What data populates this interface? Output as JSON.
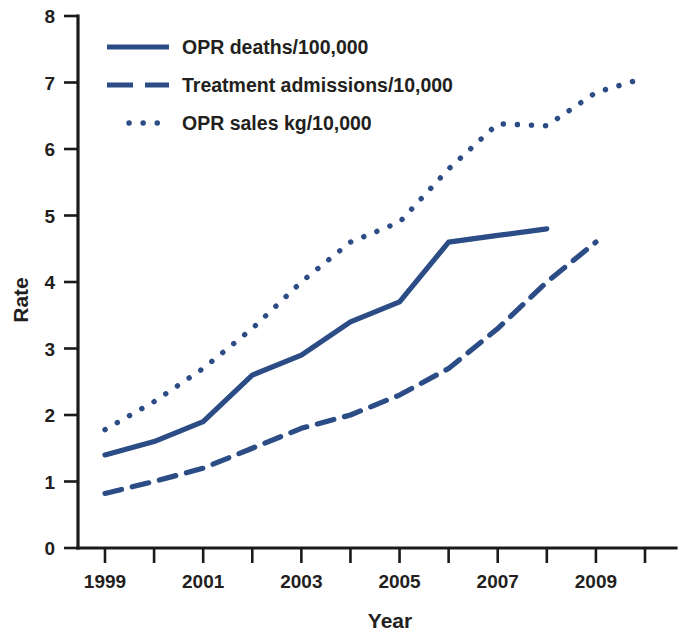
{
  "chart_data": {
    "type": "line",
    "title": "",
    "xlabel": "Year",
    "ylabel": "Rate",
    "xlim": [
      1999,
      2010
    ],
    "ylim": [
      0,
      8
    ],
    "grid": false,
    "legend_position": "top-left",
    "x": [
      1999,
      2000,
      2001,
      2002,
      2003,
      2004,
      2005,
      2006,
      2007,
      2008,
      2009,
      2010
    ],
    "xtick_labels": [
      "1999",
      "",
      "2001",
      "",
      "2003",
      "",
      "2005",
      "",
      "2007",
      "",
      "2009",
      ""
    ],
    "xticks_all": [
      1999,
      2000,
      2001,
      2002,
      2003,
      2004,
      2005,
      2006,
      2007,
      2008,
      2009,
      2010
    ],
    "ytick_labels": [
      "0",
      "1",
      "2",
      "3",
      "4",
      "5",
      "6",
      "7",
      "8"
    ],
    "yticks": [
      0,
      1,
      2,
      3,
      4,
      5,
      6,
      7,
      8
    ],
    "color": "#2c4c86",
    "series": [
      {
        "name": "OPR deaths/100,000",
        "style": "solid",
        "x": [
          1999,
          2000,
          2001,
          2002,
          2003,
          2004,
          2005,
          2006,
          2007,
          2008
        ],
        "values": [
          1.4,
          1.6,
          1.9,
          2.6,
          2.9,
          3.4,
          3.7,
          4.6,
          4.7,
          4.8
        ]
      },
      {
        "name": "Treatment admissions/10,000",
        "style": "dashed",
        "x": [
          1999,
          2000,
          2001,
          2002,
          2003,
          2004,
          2005,
          2006,
          2007,
          2008,
          2009
        ],
        "values": [
          0.82,
          1.0,
          1.2,
          1.5,
          1.8,
          2.0,
          2.3,
          2.7,
          3.3,
          4.0,
          4.6
        ]
      },
      {
        "name": "OPR sales kg/10,000",
        "style": "dotted",
        "x": [
          1999,
          2000,
          2001,
          2002,
          2003,
          2004,
          2005,
          2006,
          2007,
          2008,
          2009,
          2010
        ],
        "values": [
          1.78,
          2.2,
          2.7,
          3.3,
          4.0,
          4.6,
          4.9,
          5.7,
          6.38,
          6.35,
          6.85,
          7.07
        ]
      }
    ]
  },
  "legend": {
    "items": [
      {
        "label": "OPR deaths/100,000",
        "style": "solid"
      },
      {
        "label": "Treatment admissions/10,000",
        "style": "dashed"
      },
      {
        "label": "OPR sales kg/10,000",
        "style": "dotted"
      }
    ]
  },
  "axes": {
    "y_title": "Rate",
    "x_title": "Year"
  }
}
